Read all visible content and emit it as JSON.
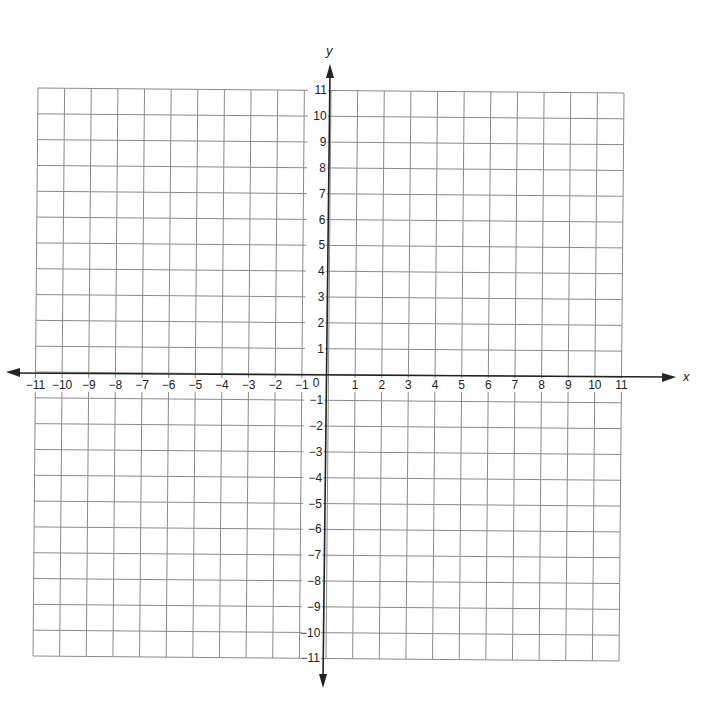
{
  "graph": {
    "x_axis_label": "x",
    "y_axis_label": "y",
    "x_min": -11,
    "x_max": 11,
    "y_min": -11,
    "y_max": 11,
    "origin_label": "0",
    "x_tick_labels": [
      "−11",
      "−10",
      "−9",
      "−8",
      "−7",
      "−6",
      "−5",
      "−4",
      "−3",
      "−2",
      "−1",
      "1",
      "2",
      "3",
      "4",
      "5",
      "6",
      "7",
      "8",
      "9",
      "10",
      "11"
    ],
    "y_tick_labels": [
      "11",
      "10",
      "9",
      "8",
      "7",
      "6",
      "5",
      "4",
      "3",
      "2",
      "1",
      "−1",
      "−2",
      "−3",
      "−4",
      "−5",
      "−6",
      "−7",
      "−8",
      "−9",
      "−10",
      "−11"
    ],
    "colors": {
      "grid": "#8a8a8a",
      "axis": "#222222",
      "background": "#ffffff"
    }
  },
  "chart_data": {
    "type": "scatter",
    "title": "",
    "xlabel": "x",
    "ylabel": "y",
    "xlim": [
      -11,
      11
    ],
    "ylim": [
      -11,
      11
    ],
    "grid": true,
    "x_ticks": [
      -11,
      -10,
      -9,
      -8,
      -7,
      -6,
      -5,
      -4,
      -3,
      -2,
      -1,
      0,
      1,
      2,
      3,
      4,
      5,
      6,
      7,
      8,
      9,
      10,
      11
    ],
    "y_ticks": [
      -11,
      -10,
      -9,
      -8,
      -7,
      -6,
      -5,
      -4,
      -3,
      -2,
      -1,
      0,
      1,
      2,
      3,
      4,
      5,
      6,
      7,
      8,
      9,
      10,
      11
    ],
    "series": [],
    "legend": null
  }
}
